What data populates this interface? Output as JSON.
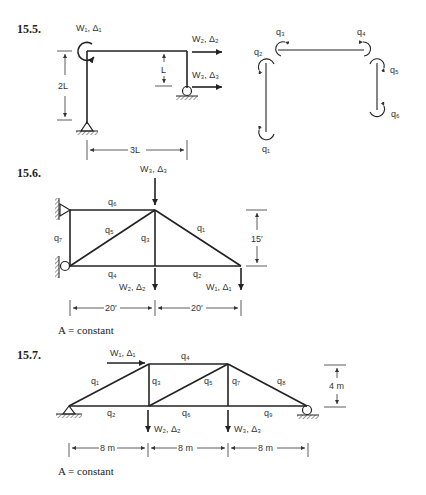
{
  "problems": [
    {
      "number": "15.5.",
      "loads": {
        "w1": "W₁, Δ₁",
        "w2": "W₂, Δ₂",
        "w3": "W₃, Δ₃"
      },
      "dims": {
        "height": "2L",
        "offset": "L",
        "width": "3L"
      },
      "coords": {
        "q1": "q₁",
        "q2": "q₂",
        "q3": "q₃",
        "q4": "q₄",
        "q5": "q₅",
        "q6": "q₆"
      }
    },
    {
      "number": "15.6.",
      "loads": {
        "w1": "W₁, Δ₁",
        "w2": "W₂, Δ₂",
        "w3": "W₃, Δ₃"
      },
      "members": {
        "q1": "q₁",
        "q2": "q₂",
        "q3": "q₃",
        "q4": "q₄",
        "q5": "q₅",
        "q6": "q₆",
        "q7": "q₇"
      },
      "dims": {
        "height": "15′",
        "span1": "20′",
        "span2": "20′"
      },
      "note": "A = constant"
    },
    {
      "number": "15.7.",
      "loads": {
        "w1": "W₁, Δ₁",
        "w2": "W₂, Δ₂",
        "w3": "W₃, Δ₃"
      },
      "members": {
        "q1": "q₁",
        "q2": "q₂",
        "q3": "q₃",
        "q4": "q₄",
        "q5": "q₅",
        "q6": "q₆",
        "q7": "q₇",
        "q8": "q₈",
        "q9": "q₉"
      },
      "dims": {
        "height": "4 m",
        "span1": "8 m",
        "span2": "8 m",
        "span3": "8 m"
      },
      "note": "A = constant"
    }
  ]
}
